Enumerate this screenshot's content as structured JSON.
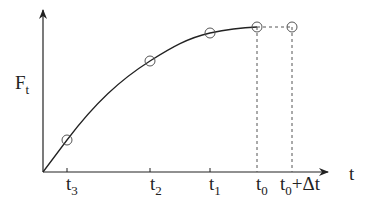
{
  "diagram": {
    "y_axis_label": {
      "main": "F",
      "sub": "t"
    },
    "x_axis_label": "t",
    "ticks": [
      {
        "main": "t",
        "sub": "3",
        "suffix": "",
        "x": 67
      },
      {
        "main": "t",
        "sub": "2",
        "suffix": "",
        "x": 150
      },
      {
        "main": "t",
        "sub": "1",
        "suffix": "",
        "x": 210
      },
      {
        "main": "t",
        "sub": "0",
        "suffix": "",
        "x": 257
      },
      {
        "main": "t",
        "sub": "0",
        "suffix": "+Δt",
        "x": 292
      }
    ],
    "points": [
      {
        "label": "t3",
        "x": 67,
        "y": 140
      },
      {
        "label": "t2",
        "x": 150,
        "y": 61
      },
      {
        "label": "t1",
        "x": 210,
        "y": 33
      },
      {
        "label": "t0",
        "x": 257,
        "y": 27
      },
      {
        "label": "t0+Δt",
        "x": 292,
        "y": 27
      }
    ],
    "colors": {
      "line": "#222222",
      "marker": "#555555",
      "dashed": "#555555"
    }
  }
}
